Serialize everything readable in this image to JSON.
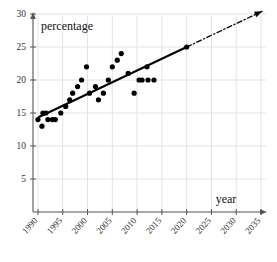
{
  "chart_data": {
    "type": "scatter",
    "title": "",
    "xlabel": "year",
    "ylabel": "percentage",
    "xlim": [
      1989,
      2036
    ],
    "ylim": [
      0,
      30
    ],
    "grid": true,
    "legend_position": "none",
    "xticks": [
      1990,
      1995,
      2000,
      2005,
      2010,
      2015,
      2020,
      2025,
      2030,
      2035
    ],
    "xtick_labels": [
      "1990",
      "1995",
      "2000",
      "2005",
      "2010",
      "2015",
      "2020",
      "2025",
      "2030",
      "2035"
    ],
    "yticks": [
      5,
      10,
      15,
      20,
      25,
      30
    ],
    "ytick_labels": [
      "5",
      "10",
      "15",
      "20",
      "25",
      "30"
    ],
    "series": [
      {
        "name": "observations",
        "type": "scatter",
        "marker": "filled-circle",
        "color": "#000000",
        "points": [
          {
            "x": 1990.0,
            "y": 14
          },
          {
            "x": 1990.8,
            "y": 13
          },
          {
            "x": 1991.0,
            "y": 15
          },
          {
            "x": 1991.6,
            "y": 15
          },
          {
            "x": 1992.0,
            "y": 14
          },
          {
            "x": 1992.9,
            "y": 14
          },
          {
            "x": 1993.5,
            "y": 14
          },
          {
            "x": 1994.6,
            "y": 15
          },
          {
            "x": 1995.6,
            "y": 16
          },
          {
            "x": 1996.4,
            "y": 17
          },
          {
            "x": 1997.0,
            "y": 18
          },
          {
            "x": 1998.0,
            "y": 19
          },
          {
            "x": 1998.8,
            "y": 20
          },
          {
            "x": 1999.8,
            "y": 22
          },
          {
            "x": 2000.4,
            "y": 18
          },
          {
            "x": 2001.6,
            "y": 19
          },
          {
            "x": 2002.2,
            "y": 17
          },
          {
            "x": 2003.2,
            "y": 18
          },
          {
            "x": 2004.2,
            "y": 20
          },
          {
            "x": 2005.0,
            "y": 22
          },
          {
            "x": 2006.0,
            "y": 23
          },
          {
            "x": 2006.8,
            "y": 24
          },
          {
            "x": 2008.2,
            "y": 21
          },
          {
            "x": 2009.4,
            "y": 18
          },
          {
            "x": 2010.4,
            "y": 20
          },
          {
            "x": 2011.0,
            "y": 20
          },
          {
            "x": 2012.2,
            "y": 20
          },
          {
            "x": 2013.4,
            "y": 20
          },
          {
            "x": 2012.0,
            "y": 22
          },
          {
            "x": 2020.0,
            "y": 25
          }
        ]
      },
      {
        "name": "trend-line-fitted",
        "type": "line",
        "style": "solid",
        "color": "#000000",
        "x_start": 1990.2,
        "y_start": 14.4,
        "x_end": 2020.0,
        "y_end": 25.0
      },
      {
        "name": "trend-line-extrapolated",
        "type": "line",
        "style": "dash-dot",
        "color": "#000000",
        "x_start": 2020.0,
        "y_start": 25.0,
        "x_end": 2035.2,
        "y_end": 30.4,
        "arrow": true
      }
    ]
  },
  "axes": {
    "x_axis_name": "x-axis",
    "y_axis_name": "y-axis",
    "x_arrow": true,
    "y_arrow": true
  },
  "colors": {
    "grid": "#e3e3e3",
    "axis": "#555555",
    "marker": "#000000",
    "text": "#1a1a1a"
  }
}
